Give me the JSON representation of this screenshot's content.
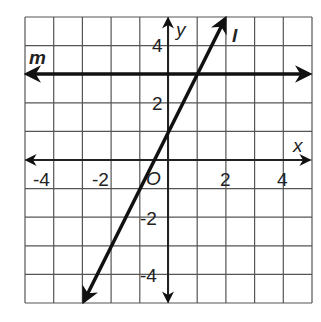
{
  "figure": {
    "grid": {
      "x_min": -5,
      "x_max": 5,
      "y_min": -5,
      "y_max": 5,
      "step": 1,
      "tick_labels_x": [
        "-4",
        "-2",
        "2",
        "4"
      ],
      "tick_labels_y": [
        "4",
        "2",
        "-2",
        "-4"
      ],
      "origin_label": "O"
    },
    "axes": {
      "x_label": "x",
      "y_label": "y"
    },
    "lines": [
      {
        "name": "m",
        "label": "m",
        "type": "horizontal",
        "y": 3,
        "equation": "y = 3"
      },
      {
        "name": "l",
        "label": "l",
        "type": "sloped",
        "slope": 2,
        "intercept": 1,
        "equation": "y = 2x + 1",
        "from": [
          -3,
          -5
        ],
        "to": [
          2,
          5
        ]
      }
    ],
    "colors": {
      "grid": "#555555",
      "axes": "#222222",
      "lines": "#111111",
      "background": "#ffffff"
    }
  }
}
